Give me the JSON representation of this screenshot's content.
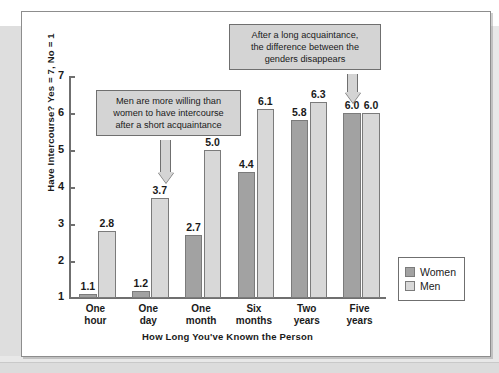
{
  "chart_data": {
    "type": "bar",
    "title": "",
    "xlabel": "How Long You've Known the Person",
    "ylabel": "Have Intercourse? Yes = 7, No = 1",
    "categories": [
      "One\nhour",
      "One\nday",
      "One\nmonth",
      "Six\nmonths",
      "Two\nyears",
      "Five\nyears"
    ],
    "ylim": [
      1,
      7
    ],
    "yticks": [
      "7",
      "6",
      "5",
      "4",
      "3",
      "2",
      "1"
    ],
    "grid": false,
    "legend_position": "right",
    "series": [
      {
        "name": "Women",
        "color": "#a2a2a2",
        "values": [
          1.1,
          1.2,
          2.7,
          4.4,
          5.8,
          6.0
        ],
        "labels": [
          "1.1",
          "1.2",
          "2.7",
          "4.4",
          "5.8",
          "6.0"
        ]
      },
      {
        "name": "Men",
        "color": "#d8d8d8",
        "values": [
          2.8,
          3.7,
          5.0,
          6.1,
          6.3,
          6.0
        ],
        "labels": [
          "2.8",
          "3.7",
          "5.0",
          "6.1",
          "6.3",
          "6.0"
        ]
      }
    ],
    "annotations": [
      {
        "id": "short-acquaintance",
        "text": "Men are more willing than\nwomen to have intercourse\nafter a short acquaintance",
        "points_to": "One day / Men"
      },
      {
        "id": "long-acquaintance",
        "text": "After a long acquaintance,\nthe difference between the\ngenders disappears",
        "points_to": "Five years"
      }
    ]
  },
  "legend": {
    "items": [
      {
        "label": "Women"
      },
      {
        "label": "Men"
      }
    ]
  }
}
